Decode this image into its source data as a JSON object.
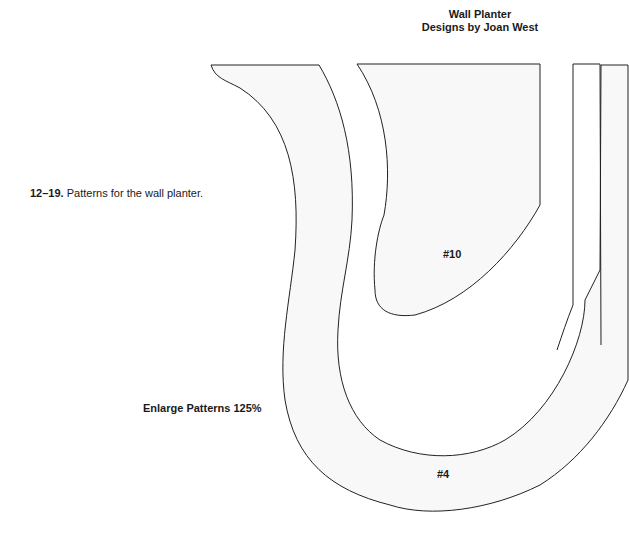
{
  "header": {
    "title_line1": "Wall Planter",
    "title_line2": "Designs by Joan West"
  },
  "caption": {
    "figure_number": "12–19.",
    "text": "Patterns for the wall planter."
  },
  "note": {
    "enlarge_text": "Enlarge Patterns 125%"
  },
  "patterns": [
    {
      "id": "pattern-4",
      "label": "#4"
    },
    {
      "id": "pattern-10",
      "label": "#10"
    },
    {
      "id": "side-strip",
      "label": ""
    }
  ],
  "colors": {
    "fill": "#f8f8f8",
    "stroke": "#222222"
  }
}
